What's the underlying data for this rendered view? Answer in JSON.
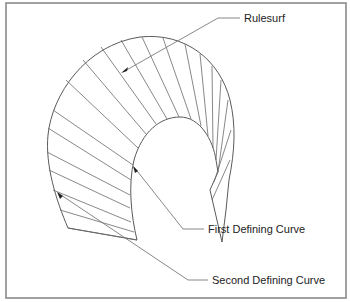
{
  "figure": {
    "title": "Rulesurf",
    "labels": [
      {
        "id": "rulesurf",
        "text": "Rulesurf"
      },
      {
        "id": "first-curve",
        "text": "First Defining Curve"
      },
      {
        "id": "second-curve",
        "text": "Second Defining Curve"
      }
    ]
  },
  "colors": {
    "frame": "#8a8a8a",
    "lines": "#5a5a5a",
    "text": "#222222",
    "background": "#ffffff"
  }
}
